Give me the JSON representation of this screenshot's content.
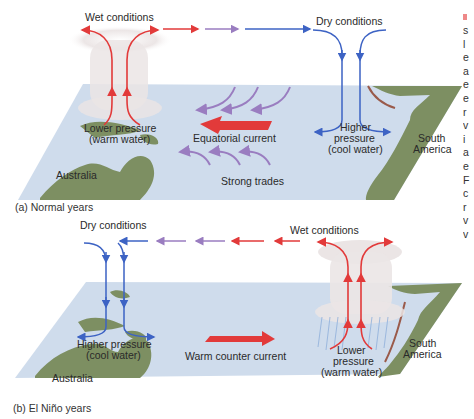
{
  "panel_a": {
    "caption": "(a) Normal years",
    "wet": "Wet conditions",
    "dry": "Dry conditions",
    "lower_pressure_1": "Lower pressure",
    "lower_pressure_2": "(warm water)",
    "higher_pressure_1": "Higher",
    "higher_pressure_2": "pressure",
    "higher_pressure_3": "(cool water)",
    "current": "Equatorial current",
    "trades": "Strong trades",
    "australia": "Australia",
    "south_america_1": "South",
    "south_america_2": "America"
  },
  "panel_b": {
    "caption": "(b) El Niño years",
    "wet": "Wet conditions",
    "dry": "Dry conditions",
    "higher_pressure_1": "Higher pressure",
    "higher_pressure_2": "(cool water)",
    "lower_pressure_1": "Lower",
    "lower_pressure_2": "pressure",
    "lower_pressure_3": "(warm water)",
    "current": "Warm counter current",
    "australia": "Australia",
    "south_america_1": "South",
    "south_america_2": "America"
  },
  "sidebar_text": [
    "s",
    "l",
    "e",
    "a",
    "e",
    "e",
    "r",
    "v",
    "i",
    "a",
    "e",
    "F",
    "c",
    "r",
    "v",
    "v"
  ],
  "colors": {
    "ocean": "#cfdcec",
    "land": "#7d8f62",
    "warm_arrow": "#e23a3a",
    "cool_arrow": "#3d63c4",
    "trade_arrow": "#9a7dc0",
    "cloud": "#ece7e7"
  }
}
